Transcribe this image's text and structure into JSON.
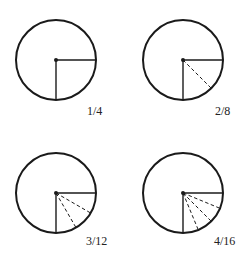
{
  "diagram": {
    "colors": {
      "stroke": "#1a1a1a",
      "background": "#ffffff"
    },
    "circles": [
      {
        "id": "one-quarter",
        "label": "1/4",
        "cx": 56,
        "cy": 60,
        "r": 40,
        "divisions": 1,
        "label_x": 87,
        "label_y": 115
      },
      {
        "id": "two-eighths",
        "label": "2/8",
        "cx": 183,
        "cy": 60,
        "r": 40,
        "divisions": 2,
        "label_x": 215,
        "label_y": 115
      },
      {
        "id": "three-twelfths",
        "label": "3/12",
        "cx": 56,
        "cy": 193,
        "r": 40,
        "divisions": 3,
        "label_x": 86,
        "label_y": 245
      },
      {
        "id": "four-sixteenths",
        "label": "4/16",
        "cx": 183,
        "cy": 193,
        "r": 40,
        "divisions": 4,
        "label_x": 214,
        "label_y": 245
      }
    ]
  }
}
